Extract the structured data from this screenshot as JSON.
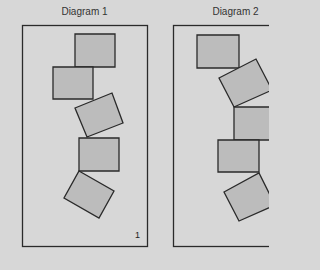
{
  "colors": {
    "background": "#d7d7d7",
    "block_fill": "#bcbcbc",
    "stroke": "#2a2a2a"
  },
  "diagrams": [
    {
      "title": "Diagram 1",
      "label": "1",
      "blocks": [
        "75,34 115,34 115,67 75,67",
        "53,67 93,67 93,99 53,99",
        "75,108 112,93 123,123 87,137",
        "79,138 119,138 119,171 79,171",
        "79,171 114,191 99,218 64,198"
      ]
    },
    {
      "title": "Diagram 2",
      "label": "",
      "blocks": [
        "197,35 239,35 239,68 197,68",
        "219,78 256,59 272,90 234,107",
        "234,107 275,107 275,140 234,140",
        "218,140 259,140 259,172 218,172",
        "224,192 259,173 275,205 239,221"
      ]
    }
  ]
}
